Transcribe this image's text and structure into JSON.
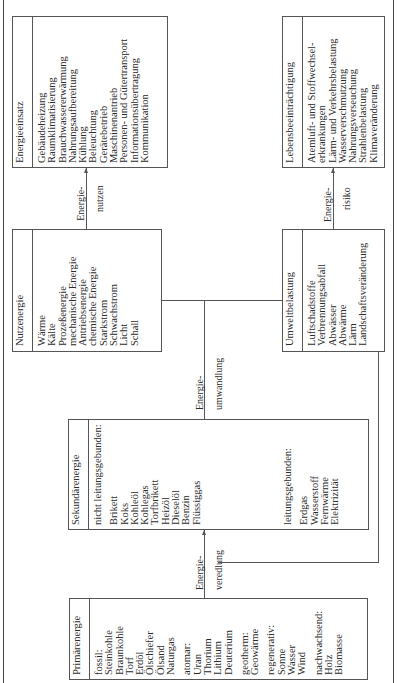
{
  "diagram": {
    "boxes": {
      "primaerenergie": {
        "title": "Primärenergie",
        "groups": [
          {
            "label": "fossil:",
            "items": [
              "Steinkohle",
              "Braunkohle",
              "Torf",
              "Erdöl",
              "Ölschiefer",
              "Ölsand",
              "Naturgas"
            ]
          },
          {
            "label": "atomar:",
            "items": [
              "Uran",
              "Thorium",
              "Lithium",
              "Deuterium"
            ]
          },
          {
            "label": "geotherm:",
            "items": [
              "Geowärme"
            ]
          },
          {
            "label": "regenerativ:",
            "items": [
              "Sonne",
              "Wasser",
              "Wind"
            ]
          },
          {
            "label": "nachwachsend:",
            "items": [
              "Holz",
              "Biomasse"
            ]
          }
        ]
      },
      "sekundaerenergie": {
        "title": "Sekundärenergie",
        "groups": [
          {
            "label": "nicht leitungsgebunden:",
            "items": [
              "Brikett",
              "Koks",
              "Kohleöl",
              "Kohlegas",
              "Torfbrikett",
              "Heizöl",
              "Dieselöl",
              "Benzin",
              "Flüssiggas"
            ]
          },
          {
            "label": "leitungsgebunden:",
            "items": [
              "Erdgas",
              "Wasserstoff",
              "Fernwärme",
              "Elektrizität"
            ]
          }
        ]
      },
      "nutzenergie": {
        "title": "Nutzenergie",
        "items": [
          "Wärme",
          "Kälte",
          "Prozeßenergie",
          "mechanische Energie",
          "Antriebsenergie",
          "chemische Energie",
          "Starkstrom",
          "Schwachstrom",
          "Licht",
          "Schall"
        ]
      },
      "energieeinsatz": {
        "title": "Energieeinsatz",
        "items": [
          "Gebäudeheizung",
          "Raumklimatisierung",
          "Brauchwassererwärmung",
          "Nahrungsaufbereitung",
          "Kühlung",
          "Beleuchtung",
          "Gerätebetrieb",
          "Maschinenantrieb",
          "Personen- und Gütertransport",
          "Informationsübertragung",
          "Kommunikation"
        ]
      },
      "umweltbelastung": {
        "title": "Umweltbelastung",
        "items": [
          "Luftschadstoffe",
          "Verbrennungsabfall",
          "Abwässer",
          "Abwärme",
          "Lärm",
          "Landschaftsveränderung"
        ]
      },
      "lebensbeeintraechtigung": {
        "title": "Lebensbeeinträchtigung",
        "items": [
          "Atemluft- und Stoffwechsel-",
          "erkrankungen",
          "Lärm- und Verkehrsbelastung",
          "Wasserverschmutzung",
          "Nahrungsverseuchung",
          "Strahlenbelastung",
          "Klimaveränderung"
        ]
      }
    },
    "connectors": {
      "veredlung": {
        "line1": "Energie-",
        "line2": "veredlung"
      },
      "umwandlung": {
        "line1": "Energie-",
        "line2": "umwandlung"
      },
      "nutzen": {
        "line1": "Energie-",
        "line2": "nutzen"
      },
      "risiko": {
        "line1": "Energie-",
        "line2": "risiko"
      }
    }
  }
}
